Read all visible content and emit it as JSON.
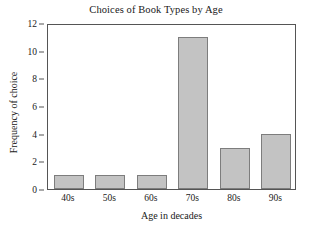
{
  "chart_data": {
    "type": "bar",
    "title": "Choices of Book Types by Age",
    "xlabel": "Age in decades",
    "ylabel": "Frequency of choice",
    "categories": [
      "40s",
      "50s",
      "60s",
      "70s",
      "80s",
      "90s"
    ],
    "values": [
      1,
      1,
      1,
      11,
      3,
      4
    ],
    "ylim": [
      0,
      12
    ],
    "yticks": [
      0,
      2,
      4,
      6,
      8,
      10,
      12
    ],
    "ytick_labels": [
      "0",
      "2",
      "4",
      "6",
      "8",
      "10",
      "12"
    ],
    "grid": false,
    "legend": null,
    "legend_position": "none",
    "bar_fill_color": "#c3c3c3",
    "bar_border_color": "#7d7d7d",
    "axis_color": "#555555",
    "background_color": "#ffffff"
  }
}
